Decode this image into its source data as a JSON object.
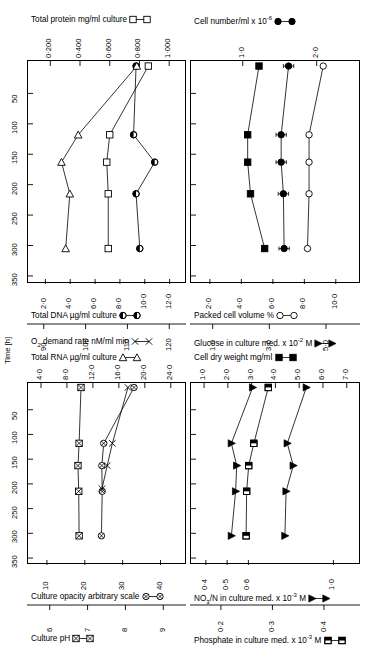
{
  "figure": {
    "time_axis": {
      "label": "Time [h]",
      "ticks": [
        "50",
        "100",
        "150",
        "200",
        "250",
        "300",
        "350"
      ],
      "tick_values": [
        50,
        100,
        150,
        200,
        250,
        300,
        350
      ],
      "range": [
        0,
        360
      ]
    }
  },
  "panels": {
    "top_left": {
      "top_axes": [
        {
          "title": "Total protein mg/ml culture",
          "symbol": "open-square",
          "ticks": [
            "0·200",
            "0·400",
            "0·600",
            "0·800",
            "1·000"
          ],
          "tick_values": [
            0.2,
            0.4,
            0.6,
            0.8,
            1.0
          ]
        }
      ],
      "bottom_axes": [
        {
          "title": "Total DNA µg/ml culture",
          "symbol": "half-filled-circle",
          "ticks": [
            "2·0",
            "4·0",
            "6·0",
            "8·0",
            "10·0",
            "12·0"
          ],
          "tick_values": [
            2,
            4,
            6,
            8,
            10,
            12
          ]
        },
        {
          "title": "Total RNA µg/ml culture",
          "symbol": "open-triangle",
          "ticks": [
            "90",
            "100",
            "110",
            "120"
          ],
          "tick_values": [
            90,
            100,
            110,
            120
          ]
        }
      ]
    },
    "top_right": {
      "top_axes": [
        {
          "title": "Cell number/ml x 10⁻⁶",
          "symbol": "filled-circle",
          "ticks": [
            "1·0",
            "2·0"
          ],
          "tick_values": [
            1.0,
            2.0
          ]
        }
      ],
      "bottom_axes": [
        {
          "title": "Packed cell volume %",
          "symbol": "open-circle",
          "ticks": [
            "2·0",
            "4·0",
            "6·0",
            "8·0",
            "10·0"
          ],
          "tick_values": [
            2,
            4,
            6,
            8,
            10
          ]
        },
        {
          "title": "Cell dry weight mg/ml",
          "symbol": "filled-square",
          "ticks": [
            "1·0",
            "3·0",
            "5·0"
          ],
          "tick_values": [
            1,
            3,
            5
          ]
        }
      ]
    },
    "bottom_left": {
      "top_axes": [
        {
          "title": "O₂ demand rate nM/ml min",
          "symbol": "cross",
          "ticks": [
            "4·0",
            "8·0",
            "12·0",
            "16·0",
            "20·0",
            "24·0"
          ],
          "tick_values": [
            4,
            8,
            12,
            16,
            20,
            24
          ]
        }
      ],
      "bottom_axes": [
        {
          "title": "Culture opacity arbitrary scale",
          "symbol": "crossed-circle",
          "ticks": [
            "10",
            "20",
            "30",
            "40"
          ],
          "tick_values": [
            10,
            20,
            30,
            40
          ]
        },
        {
          "title": "Culture pH",
          "symbol": "crossed-square",
          "ticks": [
            "6",
            "7",
            "8",
            "9"
          ],
          "tick_values": [
            6,
            7,
            8,
            9
          ]
        }
      ]
    },
    "bottom_right": {
      "top_axes": [
        {
          "title": "Glucose in culture med. x 10⁻² M",
          "symbol": "filled-triangle",
          "ticks": [
            "1·0",
            "2·0",
            "3·0",
            "4·0",
            "5·0",
            "6·0",
            "7·0"
          ],
          "tick_values": [
            1,
            2,
            3,
            4,
            5,
            6,
            7
          ]
        }
      ],
      "bottom_axes": [
        {
          "title": "NO₃/N in culture med. x 10⁻³ M",
          "symbol": "filled-triangle",
          "ticks": [
            "0·4",
            "0·5",
            "0·6",
            "1·0"
          ],
          "tick_values": [
            0.4,
            0.5,
            0.6,
            1.0
          ]
        },
        {
          "title": "Phosphate in culture med. x 10⁻³ M",
          "symbol": "half-filled-square",
          "ticks": [
            "0·2",
            "0·3",
            "0·4"
          ],
          "tick_values": [
            0.2,
            0.3,
            0.4
          ]
        }
      ]
    }
  },
  "chart_data": {
    "type": "line",
    "ylabel": "Time [h]",
    "ylim": [
      0,
      360
    ],
    "y_inverted": true,
    "grid": false,
    "legend": "axis-titles",
    "panels": [
      {
        "name": "top_left",
        "xlabels": [
          "Total protein mg/ml culture",
          "Total DNA µg/ml culture",
          "Total RNA µg/ml culture"
        ],
        "series": [
          {
            "name": "Total protein mg/ml culture",
            "symbol": "open-square",
            "axis": "top",
            "xlim": [
              0.05,
              1.12
            ],
            "points": [
              {
                "t": 5,
                "x": 0.86
              },
              {
                "t": 118,
                "x": 0.6
              },
              {
                "t": 163,
                "x": 0.58
              },
              {
                "t": 215,
                "x": 0.59
              },
              {
                "t": 305,
                "x": 0.59
              }
            ]
          },
          {
            "name": "Total DNA µg/ml culture",
            "symbol": "half-filled-circle",
            "axis": "bottom",
            "xlim": [
              0.6,
              13.4
            ],
            "points": [
              {
                "t": 5,
                "x": 9.3
              },
              {
                "t": 118,
                "x": 9.1
              },
              {
                "t": 163,
                "x": 10.8
              },
              {
                "t": 215,
                "x": 9.3
              },
              {
                "t": 305,
                "x": 9.6
              }
            ]
          },
          {
            "name": "Total RNA µg/ml culture",
            "symbol": "open-triangle",
            "axis": "bottom2",
            "xlim": [
              86,
              124
            ],
            "points": [
              {
                "t": 5,
                "x": 112
              },
              {
                "t": 118,
                "x": 98
              },
              {
                "t": 163,
                "x": 94
              },
              {
                "t": 215,
                "x": 96
              },
              {
                "t": 305,
                "x": 95
              }
            ]
          }
        ]
      },
      {
        "name": "top_right",
        "xlabels": [
          "Cell number/ml x 10⁻⁶",
          "Packed cell volume %",
          "Cell dry weight mg/ml"
        ],
        "series": [
          {
            "name": "Cell dry weight mg/ml",
            "symbol": "filled-square",
            "axis": "bottom2",
            "xlim": [
              0.2,
              6.2
            ],
            "points": [
              {
                "t": 5,
                "x": 2.6
              },
              {
                "t": 118,
                "x": 2.2
              },
              {
                "t": 163,
                "x": 2.2
              },
              {
                "t": 215,
                "x": 2.3
              },
              {
                "t": 305,
                "x": 2.8
              }
            ]
          },
          {
            "name": "Cell number/ml x 10⁻⁶",
            "symbol": "filled-circle",
            "axis": "top",
            "xlim": [
              0.3,
              2.6
            ],
            "err": 0.07,
            "points": [
              {
                "t": 5,
                "x": 1.62
              },
              {
                "t": 118,
                "x": 1.52
              },
              {
                "t": 163,
                "x": 1.52
              },
              {
                "t": 215,
                "x": 1.55
              },
              {
                "t": 305,
                "x": 1.56
              }
            ]
          },
          {
            "name": "Packed cell volume %",
            "symbol": "open-circle",
            "axis": "bottom",
            "xlim": [
              0.8,
              11.6
            ],
            "points": [
              {
                "t": 5,
                "x": 9.2
              },
              {
                "t": 118,
                "x": 8.3
              },
              {
                "t": 163,
                "x": 8.3
              },
              {
                "t": 215,
                "x": 8.3
              },
              {
                "t": 305,
                "x": 8.2
              }
            ]
          }
        ]
      },
      {
        "name": "bottom_left",
        "xlabels": [
          "O₂ demand rate nM/ml min",
          "Culture opacity arbitrary scale",
          "Culture pH"
        ],
        "series": [
          {
            "name": "Culture pH",
            "symbol": "crossed-square",
            "axis": "bottom2",
            "xlim": [
              5.4,
              9.6
            ],
            "points": [
              {
                "t": 5,
                "x": 6.8
              },
              {
                "t": 118,
                "x": 6.75
              },
              {
                "t": 163,
                "x": 6.72
              },
              {
                "t": 215,
                "x": 6.74
              },
              {
                "t": 305,
                "x": 6.75
              }
            ]
          },
          {
            "name": "Culture opacity arbitrary scale",
            "symbol": "crossed-circle",
            "axis": "bottom",
            "xlim": [
              5,
              47
            ],
            "points": [
              {
                "t": 5,
                "x": 33
              },
              {
                "t": 118,
                "x": 25
              },
              {
                "t": 163,
                "x": 24.5
              },
              {
                "t": 215,
                "x": 24.6
              },
              {
                "t": 305,
                "x": 24.4
              }
            ]
          },
          {
            "name": "O₂ demand rate nM/ml min",
            "symbol": "cross",
            "axis": "top",
            "xlim": [
              2,
              26.5
            ],
            "points": [
              {
                "t": 5,
                "x": 17.4
              },
              {
                "t": 118,
                "x": 15.0
              },
              {
                "t": 163,
                "x": 14.2
              },
              {
                "t": 210,
                "x": 13.4
              }
            ]
          }
        ]
      },
      {
        "name": "bottom_right",
        "xlabels": [
          "Glucose in culture med. x 10⁻² M",
          "NO₃/N in culture med. x 10⁻³ M",
          "Phosphate in culture med. x 10⁻³ M"
        ],
        "series": [
          {
            "name": "NO₃/N in culture med. x 10⁻³ M",
            "symbol": "filled-triangle",
            "axis": "bottom",
            "xlim": [
              0.33,
              1.13
            ],
            "points": [
              {
                "t": 5,
                "x": 0.62
              },
              {
                "t": 118,
                "x": 0.52
              },
              {
                "t": 163,
                "x": 0.545
              },
              {
                "t": 215,
                "x": 0.54
              },
              {
                "t": 305,
                "x": 0.52
              }
            ]
          },
          {
            "name": "Phosphate in culture med. x 10⁻³ M",
            "symbol": "half-filled-square",
            "axis": "bottom2",
            "xlim": [
              0.14,
              0.47
            ],
            "points": [
              {
                "t": 5,
                "x": 0.29
              },
              {
                "t": 118,
                "x": 0.262
              },
              {
                "t": 163,
                "x": 0.252
              },
              {
                "t": 215,
                "x": 0.248
              },
              {
                "t": 305,
                "x": 0.247
              }
            ]
          },
          {
            "name": "Glucose in culture med. x 10⁻² M",
            "symbol": "filled-triangle",
            "axis": "top",
            "xlim": [
              0.45,
              7.6
            ],
            "points": [
              {
                "t": 5,
                "x": 5.3
              },
              {
                "t": 118,
                "x": 4.5
              },
              {
                "t": 163,
                "x": 4.75
              },
              {
                "t": 215,
                "x": 4.45
              },
              {
                "t": 305,
                "x": 4.4
              }
            ]
          }
        ]
      }
    ]
  }
}
